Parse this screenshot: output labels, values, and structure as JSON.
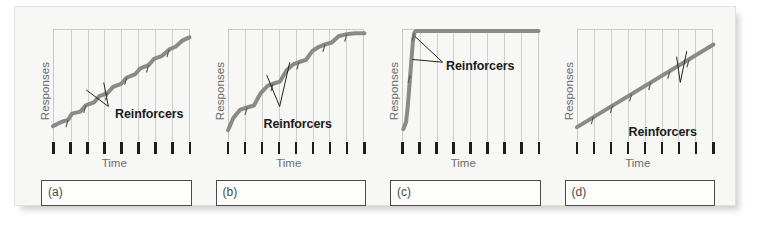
{
  "figure": {
    "background_color": "#f7f7f6",
    "border_color": "#e2e2e0"
  },
  "labels": {
    "y_axis": "Responses",
    "x_axis": "Time",
    "callout": "Reinforcers"
  },
  "chart_data": [
    {
      "type": "line",
      "panel": "(a)",
      "title": "",
      "xlabel": "Time",
      "ylabel": "Responses",
      "grid": true,
      "grid_columns": 8,
      "tick_count": 9,
      "annotation": "Reinforcers",
      "series": [
        {
          "name": "cumulative record",
          "description": "steady moderate slope with small regular step/scallop pattern",
          "points": [
            [
              0,
              6
            ],
            [
              6,
              10
            ],
            [
              11,
              12
            ],
            [
              14,
              18
            ],
            [
              20,
              20
            ],
            [
              24,
              26
            ],
            [
              30,
              29
            ],
            [
              34,
              35
            ],
            [
              40,
              38
            ],
            [
              44,
              44
            ],
            [
              50,
              47
            ],
            [
              54,
              53
            ],
            [
              60,
              56
            ],
            [
              64,
              62
            ],
            [
              70,
              65
            ],
            [
              74,
              71
            ],
            [
              80,
              74
            ],
            [
              85,
              80
            ],
            [
              90,
              83
            ],
            [
              95,
              89
            ],
            [
              100,
              92
            ]
          ]
        }
      ],
      "reinforcer_marks": [
        [
          11,
          12
        ],
        [
          24,
          26
        ],
        [
          40,
          38
        ],
        [
          54,
          53
        ],
        [
          70,
          65
        ],
        [
          85,
          80
        ]
      ],
      "xlim": [
        0,
        100
      ],
      "ylim": [
        0,
        100
      ],
      "color": "#8a8a88"
    },
    {
      "type": "line",
      "panel": "(b)",
      "title": "",
      "xlabel": "Time",
      "ylabel": "Responses",
      "grid": true,
      "grid_columns": 8,
      "tick_count": 9,
      "annotation": "Reinforcers",
      "series": [
        {
          "name": "cumulative record",
          "description": "stair-step pattern: bursts of responding separated by short pauses after each reinforcer",
          "points": [
            [
              0,
              2
            ],
            [
              4,
              14
            ],
            [
              9,
              22
            ],
            [
              14,
              24
            ],
            [
              19,
              26
            ],
            [
              24,
              38
            ],
            [
              29,
              45
            ],
            [
              33,
              47
            ],
            [
              38,
              49
            ],
            [
              43,
              60
            ],
            [
              48,
              66
            ],
            [
              52,
              68
            ],
            [
              57,
              70
            ],
            [
              62,
              79
            ],
            [
              67,
              83
            ],
            [
              71,
              85
            ],
            [
              76,
              87
            ],
            [
              81,
              93
            ],
            [
              87,
              95
            ],
            [
              93,
              96
            ],
            [
              100,
              96
            ]
          ]
        }
      ],
      "reinforcer_marks": [
        [
          14,
          24
        ],
        [
          33,
          47
        ],
        [
          52,
          68
        ],
        [
          71,
          85
        ],
        [
          87,
          95
        ]
      ],
      "xlim": [
        0,
        100
      ],
      "ylim": [
        0,
        100
      ],
      "color": "#8a8a88"
    },
    {
      "type": "line",
      "panel": "(c)",
      "title": "",
      "xlabel": "Time",
      "ylabel": "Responses",
      "grid": true,
      "grid_columns": 8,
      "tick_count": 9,
      "annotation": "Reinforcers",
      "series": [
        {
          "name": "cumulative record",
          "description": "very steep near-vertical burst of responding early, then flat (no further responding)",
          "points": [
            [
              1,
              3
            ],
            [
              3,
              10
            ],
            [
              4,
              22
            ],
            [
              5,
              38
            ],
            [
              6,
              55
            ],
            [
              7,
              72
            ],
            [
              8,
              88
            ],
            [
              9,
              96
            ],
            [
              10,
              98
            ],
            [
              100,
              98
            ]
          ]
        }
      ],
      "reinforcer_marks": [
        [
          6,
          55
        ],
        [
          9,
          96
        ]
      ],
      "xlim": [
        0,
        100
      ],
      "ylim": [
        0,
        100
      ],
      "color": "#8a8a88"
    },
    {
      "type": "line",
      "panel": "(d)",
      "title": "",
      "xlabel": "Time",
      "ylabel": "Responses",
      "grid": true,
      "grid_columns": 8,
      "tick_count": 9,
      "annotation": "Reinforcers",
      "series": [
        {
          "name": "cumulative record",
          "description": "smooth, steady, constant moderate rate with evenly spaced reinforcer marks",
          "points": [
            [
              0,
              5
            ],
            [
              100,
              85
            ]
          ]
        }
      ],
      "reinforcer_marks": [
        [
          12,
          15
        ],
        [
          26,
          26
        ],
        [
          40,
          37
        ],
        [
          54,
          48
        ],
        [
          68,
          59
        ],
        [
          82,
          70
        ]
      ],
      "xlim": [
        0,
        100
      ],
      "ylim": [
        0,
        100
      ],
      "color": "#8a8a88"
    }
  ],
  "panels": [
    {
      "id": "a",
      "tag": "(a)",
      "answer": ""
    },
    {
      "id": "b",
      "tag": "(b)",
      "answer": ""
    },
    {
      "id": "c",
      "tag": "(c)",
      "answer": ""
    },
    {
      "id": "d",
      "tag": "(d)",
      "answer": ""
    }
  ]
}
